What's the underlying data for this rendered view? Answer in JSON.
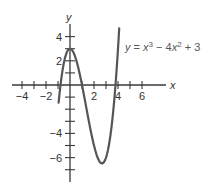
{
  "chart_data": {
    "type": "line",
    "title": "",
    "xlabel": "x",
    "ylabel": "y",
    "equation": "y = x³ − 4x² + 3",
    "equation_parts": {
      "lhs": "y",
      "eq": " = ",
      "x1": "x",
      "exp1": "3",
      "minus": " − 4",
      "x2": "x",
      "exp2": "2",
      "plus": " + 3"
    },
    "xlim": [
      -4.8,
      7.8
    ],
    "ylim": [
      -7.8,
      5.8
    ],
    "x_ticks": [
      -4,
      -3,
      -2,
      -1,
      1,
      2,
      3,
      4,
      5,
      6
    ],
    "x_tick_labels": [
      {
        "value": -4,
        "label": "−4"
      },
      {
        "value": -2,
        "label": "−2"
      },
      {
        "value": 2,
        "label": "2"
      },
      {
        "value": 4,
        "label": "4"
      },
      {
        "value": 6,
        "label": "6"
      }
    ],
    "y_ticks": [
      -7,
      -6,
      -5,
      -4,
      -3,
      -2,
      -1,
      1,
      2,
      3,
      4
    ],
    "y_tick_labels": [
      {
        "value": 4,
        "label": "4"
      },
      {
        "value": 2,
        "label": "2"
      },
      {
        "value": -4,
        "label": "−4"
      },
      {
        "value": -6,
        "label": "−6"
      }
    ],
    "grid": false,
    "legend": "none",
    "series": [
      {
        "name": "y = x³ − 4x² + 3",
        "function": "x^3 - 4x^2 + 3",
        "x_range": [
          -0.95,
          4.1
        ],
        "x": [
          -0.95,
          -0.5,
          0,
          0.5,
          1,
          1.5,
          2,
          2.5,
          2.67,
          3,
          3.5,
          4,
          4.1
        ],
        "values": [
          -1.47,
          1.88,
          3,
          2.13,
          0,
          -2.63,
          -5,
          -6.38,
          -6.48,
          -6,
          -3.13,
          3,
          5.68
        ]
      }
    ],
    "key_points": [
      {
        "label": "local max",
        "x": 0,
        "y": 3
      },
      {
        "label": "local min",
        "x": 2.67,
        "y": -6.48
      }
    ],
    "colors": {
      "axis": "#3a3a3a",
      "curve": "#555555",
      "text": "#333333"
    }
  }
}
